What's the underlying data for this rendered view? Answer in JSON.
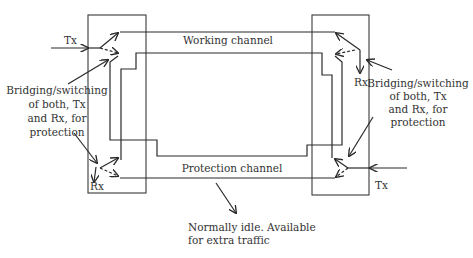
{
  "diagram": {
    "type": "1+1 / 1:1 protection switching",
    "colors": {
      "line": "#2a2a2a",
      "text": "#333333",
      "background": "#ffffff"
    },
    "channels": {
      "working": "Working channel",
      "protection": "Protection channel"
    },
    "left_node": {
      "tx_label": "Tx",
      "rx_label": "Rx",
      "annotation": [
        "Bridging/switching",
        "of both, Tx",
        "and Rx, for",
        "protection"
      ]
    },
    "right_node": {
      "tx_label": "Tx",
      "rx_label": "Rx",
      "annotation": [
        "Bridging/switching",
        "of both, Tx",
        "and Rx, for",
        "protection"
      ]
    },
    "protection_note": [
      "Normally idle. Available",
      "for extra traffic"
    ]
  }
}
